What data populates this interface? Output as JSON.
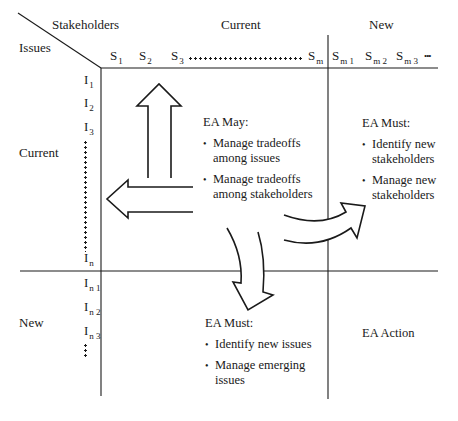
{
  "axes": {
    "corner_top_label": "Stakeholders",
    "corner_left_label": "Issues",
    "column_groups": [
      {
        "label": "Current"
      },
      {
        "label": "New"
      }
    ],
    "row_groups": [
      {
        "label": "Current"
      },
      {
        "label": "New"
      }
    ]
  },
  "stakeholders": {
    "current": [
      {
        "base": "S",
        "sub": "1"
      },
      {
        "base": "S",
        "sub": "2"
      },
      {
        "base": "S",
        "sub": "3"
      },
      {
        "base": "S",
        "sub": "m"
      }
    ],
    "new": [
      {
        "base": "S",
        "sub": "m 1"
      },
      {
        "base": "S",
        "sub": "m 2"
      },
      {
        "base": "S",
        "sub": "m 3"
      }
    ],
    "trailing_ellipsis": "•••"
  },
  "issues": {
    "current": [
      {
        "base": "I",
        "sub": "1"
      },
      {
        "base": "I",
        "sub": "2"
      },
      {
        "base": "I",
        "sub": "3"
      },
      {
        "base": "I",
        "sub": "n"
      }
    ],
    "new": [
      {
        "base": "I",
        "sub": "n 1"
      },
      {
        "base": "I",
        "sub": "n 2"
      },
      {
        "base": "I",
        "sub": "n 3"
      }
    ]
  },
  "quadrants": {
    "current_current": {
      "heading": "EA May:",
      "items": [
        "Manage tradeoffs among issues",
        "Manage tradeoffs among stakeholders"
      ]
    },
    "current_issues_new_stakeholders": {
      "heading": "EA Must:",
      "items": [
        "Identify new stakeholders",
        "Manage new stakeholders"
      ]
    },
    "new_issues_current_stakeholders": {
      "heading": "EA Must:",
      "items": [
        "Identify new issues",
        "Manage emerging issues"
      ]
    },
    "new_new": {
      "heading": "EA Action"
    }
  },
  "arrows": [
    {
      "name": "up-arrow",
      "direction": "up"
    },
    {
      "name": "left-arrow",
      "direction": "left"
    },
    {
      "name": "curved-right-arrow",
      "direction": "right"
    },
    {
      "name": "curved-down-arrow",
      "direction": "down"
    }
  ]
}
